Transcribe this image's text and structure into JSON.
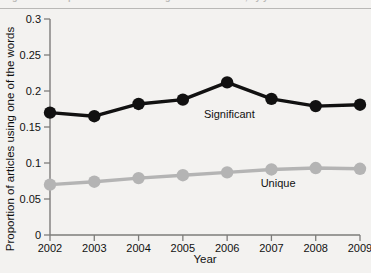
{
  "caption": {
    "text": "Figure 1 — Proportion of articles using one of the words, by year"
  },
  "chart_data": {
    "type": "line",
    "title": "",
    "xlabel": "Year",
    "ylabel": "Proportion of articles using one of the words",
    "x": [
      2002,
      2003,
      2004,
      2005,
      2006,
      2007,
      2008,
      2009
    ],
    "categories": [
      "2002",
      "2003",
      "2004",
      "2005",
      "2006",
      "2007",
      "2008",
      "2009"
    ],
    "xtick_labels": [
      "2002",
      "2003",
      "2004",
      "2005",
      "2006",
      "2007",
      "2008",
      "2009"
    ],
    "ytick_labels": [
      "0",
      "0.05",
      "0.1",
      "0.15",
      "0.2",
      "0.25",
      "0.3"
    ],
    "ytick_values": [
      0,
      0.05,
      0.1,
      0.15,
      0.2,
      0.25,
      0.3
    ],
    "ylim": [
      0,
      0.3
    ],
    "xlim": [
      2002,
      2009
    ],
    "grid": false,
    "legend_position": "inline-annotation",
    "series": [
      {
        "name": "Significant",
        "color": "#111111",
        "marker": "circle",
        "values": [
          0.17,
          0.165,
          0.182,
          0.188,
          0.212,
          0.189,
          0.179,
          0.181
        ],
        "label_x": 2006.05,
        "label_y": 0.162
      },
      {
        "name": "Unique",
        "color": "#b4b4b4",
        "marker": "circle",
        "values": [
          0.07,
          0.074,
          0.079,
          0.083,
          0.087,
          0.091,
          0.093,
          0.092
        ],
        "label_x": 2007.15,
        "label_y": 0.067
      }
    ],
    "annotations": [
      {
        "text": "Significant",
        "series": "Significant"
      },
      {
        "text": "Unique",
        "series": "Unique"
      }
    ]
  }
}
